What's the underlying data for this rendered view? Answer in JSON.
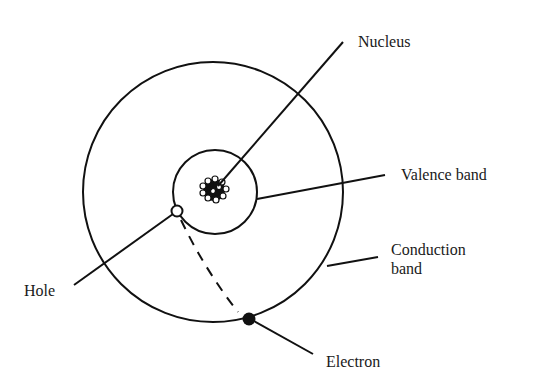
{
  "diagram": {
    "type": "atom-band-model",
    "labels": {
      "nucleus": "Nucleus",
      "valence_band": "Valence band",
      "conduction_band_line1": "Conduction",
      "conduction_band_line2": "band",
      "hole": "Hole",
      "electron": "Electron"
    },
    "colors": {
      "stroke": "#111111",
      "background": "#ffffff"
    },
    "geometry": {
      "outer_circle": {
        "cx": 213,
        "cy": 192,
        "r": 130
      },
      "inner_circle": {
        "cx": 215,
        "cy": 192,
        "r": 42
      },
      "nucleus_center": {
        "cx": 214,
        "cy": 190
      },
      "hole": {
        "cx": 177,
        "cy": 211,
        "r": 5
      },
      "electron": {
        "cx": 249,
        "cy": 319,
        "r": 6
      }
    }
  }
}
